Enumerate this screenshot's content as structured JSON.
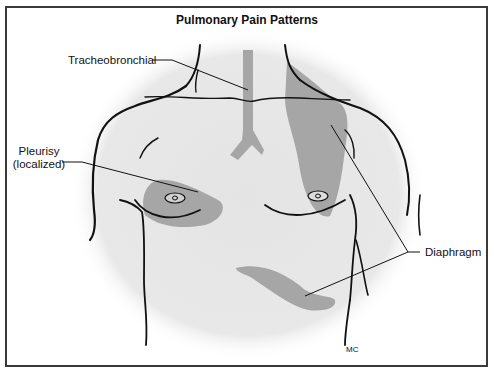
{
  "figure": {
    "title": "Pulmonary Pain Patterns",
    "labels": {
      "tracheobronchial": "Tracheobronchial",
      "pleurisy_line1": "Pleurisy",
      "pleurisy_line2": "(localized)",
      "diaphragm": "Diaphragm"
    },
    "signature": "MC",
    "colors": {
      "pain_region": "#a6a6a6",
      "body_glow": "#e6e6e6",
      "outline": "#111111",
      "frame": "#3a3a3a"
    },
    "regions": [
      {
        "name": "Tracheobronchial",
        "location": "trachea and bronchi, center of upper chest"
      },
      {
        "name": "Pleurisy (localized)",
        "location": "right upper chest above nipple"
      },
      {
        "name": "Diaphragm",
        "location": "left shoulder/trapezius region"
      },
      {
        "name": "Diaphragm",
        "location": "lower costal margin below left breast"
      }
    ]
  }
}
